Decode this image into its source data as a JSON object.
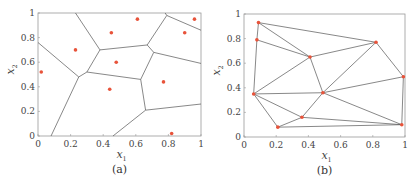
{
  "figure": {
    "panels": [
      {
        "caption": "(a)",
        "xlabel": "x",
        "xlabel_sub": "1",
        "ylabel": "x",
        "ylabel_sub": "2"
      },
      {
        "caption": "(b)",
        "xlabel": "x",
        "xlabel_sub": "1",
        "ylabel": "x",
        "ylabel_sub": "2"
      }
    ],
    "xticks": [
      "0",
      "0.2",
      "0.4",
      "0.6",
      "0.8",
      "1"
    ],
    "yticks": [
      "0",
      "0.2",
      "0.4",
      "0.6",
      "0.8",
      "1"
    ],
    "colors": {
      "point": "#e8533a",
      "line": "#555555",
      "axis": "#999999"
    }
  },
  "chart_data": [
    {
      "type": "scatter",
      "title": "(a) Voronoi diagram",
      "xlabel": "x1",
      "ylabel": "x2",
      "xlim": [
        0,
        1
      ],
      "ylim": [
        0,
        1
      ],
      "points": [
        [
          0.02,
          0.52
        ],
        [
          0.23,
          0.7
        ],
        [
          0.45,
          0.84
        ],
        [
          0.61,
          0.95
        ],
        [
          0.48,
          0.6
        ],
        [
          0.44,
          0.38
        ],
        [
          0.77,
          0.44
        ],
        [
          0.9,
          0.84
        ],
        [
          0.96,
          0.95
        ],
        [
          0.82,
          0.02
        ]
      ],
      "edges": [
        [
          [
            0,
            0.76
          ],
          [
            0.25,
            0.48
          ]
        ],
        [
          [
            0.25,
            0.48
          ],
          [
            0.08,
            0
          ]
        ],
        [
          [
            0.25,
            0.48
          ],
          [
            0.3,
            0.52
          ]
        ],
        [
          [
            0.3,
            0.52
          ],
          [
            0.38,
            0.7
          ]
        ],
        [
          [
            0.38,
            0.7
          ],
          [
            0.23,
            1.0
          ]
        ],
        [
          [
            0.38,
            0.7
          ],
          [
            0.67,
            0.74
          ]
        ],
        [
          [
            0.67,
            0.74
          ],
          [
            0.79,
            0.98
          ]
        ],
        [
          [
            0.67,
            0.74
          ],
          [
            0.71,
            0.68
          ]
        ],
        [
          [
            0.79,
            0.98
          ],
          [
            1.0,
            0.86
          ]
        ],
        [
          [
            0.79,
            0.98
          ],
          [
            0.78,
            1.0
          ]
        ],
        [
          [
            0.71,
            0.68
          ],
          [
            1.0,
            0.59
          ]
        ],
        [
          [
            0.71,
            0.68
          ],
          [
            0.63,
            0.46
          ]
        ],
        [
          [
            0.3,
            0.52
          ],
          [
            0.63,
            0.46
          ]
        ],
        [
          [
            0.63,
            0.46
          ],
          [
            0.66,
            0.21
          ]
        ],
        [
          [
            0.66,
            0.21
          ],
          [
            1.0,
            0.26
          ]
        ],
        [
          [
            0.66,
            0.21
          ],
          [
            0.46,
            0
          ]
        ]
      ],
      "grid": false
    },
    {
      "type": "scatter",
      "title": "(b) Delaunay triangulation",
      "xlabel": "x1",
      "ylabel": "x2",
      "xlim": [
        0,
        1
      ],
      "ylim": [
        0,
        1
      ],
      "points": [
        [
          0.09,
          0.93
        ],
        [
          0.08,
          0.79
        ],
        [
          0.41,
          0.65
        ],
        [
          0.82,
          0.77
        ],
        [
          0.99,
          0.49
        ],
        [
          0.06,
          0.35
        ],
        [
          0.49,
          0.36
        ],
        [
          0.36,
          0.16
        ],
        [
          0.21,
          0.08
        ],
        [
          0.98,
          0.1
        ]
      ],
      "triangles_edges": [
        [
          0,
          1
        ],
        [
          0,
          2
        ],
        [
          0,
          3
        ],
        [
          1,
          2
        ],
        [
          1,
          5
        ],
        [
          2,
          3
        ],
        [
          2,
          5
        ],
        [
          2,
          6
        ],
        [
          3,
          6
        ],
        [
          3,
          4
        ],
        [
          4,
          6
        ],
        [
          4,
          9
        ],
        [
          5,
          6
        ],
        [
          5,
          7
        ],
        [
          5,
          8
        ],
        [
          6,
          7
        ],
        [
          6,
          9
        ],
        [
          7,
          8
        ],
        [
          7,
          9
        ],
        [
          8,
          9
        ]
      ],
      "grid": false
    }
  ]
}
